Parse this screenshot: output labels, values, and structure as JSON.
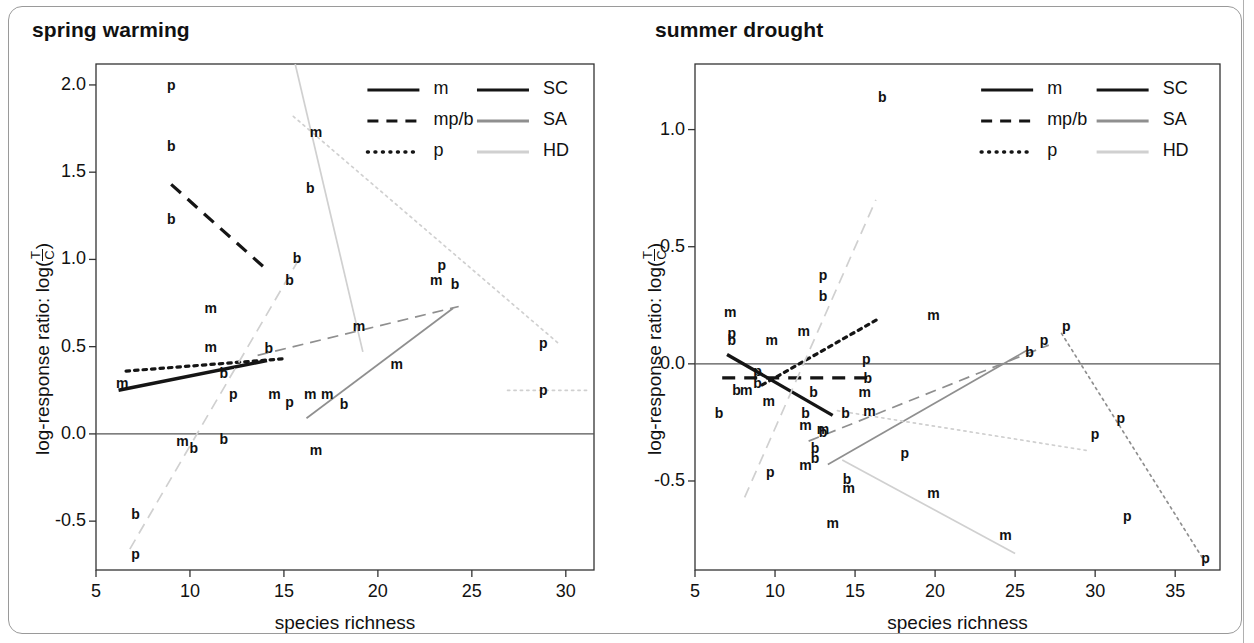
{
  "figure": {
    "panels": [
      {
        "id": "spring-warming",
        "title": "spring warming",
        "xlabel": "species richness",
        "ylabel_prefix": "log-response ratio: log(",
        "ylabel_num": "T",
        "ylabel_den": "C",
        "ylabel_suffix": ")",
        "xticks": [
          "5",
          "10",
          "15",
          "20",
          "25",
          "30"
        ],
        "yticks": [
          "2.0",
          "1.5",
          "1.0",
          "0.5",
          "0.0",
          "-0.5"
        ]
      },
      {
        "id": "summer-drought",
        "title": "summer drought",
        "xlabel": "species richness",
        "ylabel_prefix": "log-response ratio: log(",
        "ylabel_num": "T",
        "ylabel_den": "C",
        "ylabel_suffix": ")",
        "xticks": [
          "5",
          "10",
          "15",
          "20",
          "25",
          "30",
          "35"
        ],
        "yticks": [
          "1.0",
          "0.5",
          "0.0",
          "-0.5"
        ]
      }
    ],
    "legend": {
      "linestyle_entries": [
        {
          "label": "m",
          "style": "solid"
        },
        {
          "label": "mp/b",
          "style": "dashed"
        },
        {
          "label": "p",
          "style": "dotted"
        }
      ],
      "color_entries": [
        {
          "label": "SC",
          "color": "#151515"
        },
        {
          "label": "SA",
          "color": "#8f8f8f"
        },
        {
          "label": "HD",
          "color": "#d0d0d0"
        }
      ]
    },
    "colors": {
      "SC": "#151515",
      "SA": "#8f8f8f",
      "HD": "#d0d0d0",
      "zero_line": "#555555",
      "axis": "#333333"
    }
  },
  "chart_data": [
    {
      "type": "scatter",
      "title": "spring warming",
      "xlabel": "species richness",
      "ylabel": "log-response ratio: log(T/C)",
      "xlim": [
        5,
        31.5
      ],
      "ylim": [
        -0.78,
        2.12
      ],
      "xticks": [
        5,
        10,
        15,
        20,
        25,
        30
      ],
      "yticks": [
        2.0,
        1.5,
        1.0,
        0.5,
        0.0,
        -0.5
      ],
      "grid": false,
      "zero_reference_line": 0.0,
      "legend_position": "top-right",
      "point_label_key": "m = mass loss, b = biomass, p = plant/production",
      "points": [
        {
          "label": "p",
          "x": 9.0,
          "y": 2.0
        },
        {
          "label": "b",
          "x": 9.0,
          "y": 1.65
        },
        {
          "label": "b",
          "x": 9.0,
          "y": 1.23
        },
        {
          "label": "m",
          "x": 16.7,
          "y": 1.73
        },
        {
          "label": "b",
          "x": 16.4,
          "y": 1.41
        },
        {
          "label": "b",
          "x": 15.7,
          "y": 1.01
        },
        {
          "label": "b",
          "x": 15.3,
          "y": 0.88
        },
        {
          "label": "p",
          "x": 23.4,
          "y": 0.97
        },
        {
          "label": "m",
          "x": 23.1,
          "y": 0.88
        },
        {
          "label": "b",
          "x": 24.1,
          "y": 0.86
        },
        {
          "label": "m",
          "x": 11.1,
          "y": 0.72
        },
        {
          "label": "m",
          "x": 11.1,
          "y": 0.5
        },
        {
          "label": "b",
          "x": 14.2,
          "y": 0.49
        },
        {
          "label": "m",
          "x": 19.0,
          "y": 0.62
        },
        {
          "label": "m",
          "x": 21.0,
          "y": 0.4
        },
        {
          "label": "b",
          "x": 11.8,
          "y": 0.35
        },
        {
          "label": "m",
          "x": 6.4,
          "y": 0.29
        },
        {
          "label": "p",
          "x": 28.8,
          "y": 0.52
        },
        {
          "label": "p",
          "x": 28.8,
          "y": 0.25
        },
        {
          "label": "p",
          "x": 12.3,
          "y": 0.23
        },
        {
          "label": "m",
          "x": 14.5,
          "y": 0.23
        },
        {
          "label": "p",
          "x": 15.3,
          "y": 0.18
        },
        {
          "label": "m",
          "x": 16.4,
          "y": 0.23
        },
        {
          "label": "m",
          "x": 17.3,
          "y": 0.23
        },
        {
          "label": "b",
          "x": 18.2,
          "y": 0.17
        },
        {
          "label": "m",
          "x": 9.6,
          "y": -0.04
        },
        {
          "label": "b",
          "x": 11.8,
          "y": -0.03
        },
        {
          "label": "b",
          "x": 10.2,
          "y": -0.08
        },
        {
          "label": "m",
          "x": 16.7,
          "y": -0.09
        },
        {
          "label": "b",
          "x": 7.1,
          "y": -0.46
        },
        {
          "label": "p",
          "x": 7.1,
          "y": -0.69
        }
      ],
      "trend_lines": [
        {
          "group": "SC",
          "type": "m",
          "style": "solid",
          "color": "#151515",
          "x": [
            6.2,
            14.1
          ],
          "y": [
            0.25,
            0.42
          ]
        },
        {
          "group": "SC",
          "type": "mp/b",
          "style": "dashed",
          "color": "#151515",
          "x": [
            9.0,
            14.2
          ],
          "y": [
            1.43,
            0.93
          ]
        },
        {
          "group": "SC",
          "type": "p",
          "style": "dotted",
          "color": "#151515",
          "x": [
            6.6,
            14.9
          ],
          "y": [
            0.36,
            0.43
          ]
        },
        {
          "group": "SA",
          "type": "m",
          "style": "solid",
          "color": "#8f8f8f",
          "x": [
            16.2,
            24.0
          ],
          "y": [
            0.09,
            0.72
          ]
        },
        {
          "group": "SA",
          "type": "mp/b",
          "style": "dashed",
          "color": "#8f8f8f",
          "x": [
            13.6,
            24.3
          ],
          "y": [
            0.45,
            0.73
          ]
        },
        {
          "group": "HD",
          "type": "m",
          "style": "solid",
          "color": "#d0d0d0",
          "x": [
            15.6,
            19.2
          ],
          "y": [
            2.12,
            0.47
          ]
        },
        {
          "group": "HD",
          "type": "mp/b",
          "style": "dashed",
          "color": "#d0d0d0",
          "x": [
            6.8,
            15.9
          ],
          "y": [
            -0.66,
            1.02
          ]
        },
        {
          "group": "HD",
          "type": "p",
          "style": "dotted",
          "color": "#d0d0d0",
          "x": [
            15.5,
            29.6
          ],
          "y": [
            1.82,
            0.52
          ]
        },
        {
          "group": "HD",
          "type": "p2",
          "style": "dotted",
          "color": "#d0d0d0",
          "x": [
            26.9,
            31.3
          ],
          "y": [
            0.25,
            0.25
          ]
        }
      ]
    },
    {
      "type": "scatter",
      "title": "summer drought",
      "xlabel": "species richness",
      "ylabel": "log-response ratio: log(T/C)",
      "xlim": [
        5,
        37.8
      ],
      "ylim": [
        -0.88,
        1.28
      ],
      "xticks": [
        5,
        10,
        15,
        20,
        25,
        30,
        35
      ],
      "yticks": [
        1.0,
        0.5,
        0.0,
        -0.5
      ],
      "grid": false,
      "zero_reference_line": 0.0,
      "legend_position": "top-right",
      "points": [
        {
          "label": "b",
          "x": 16.7,
          "y": 1.14
        },
        {
          "label": "p",
          "x": 13.0,
          "y": 0.38
        },
        {
          "label": "b",
          "x": 13.0,
          "y": 0.29
        },
        {
          "label": "m",
          "x": 7.2,
          "y": 0.22
        },
        {
          "label": "m",
          "x": 19.9,
          "y": 0.21
        },
        {
          "label": "b",
          "x": 7.3,
          "y": 0.1
        },
        {
          "label": "p",
          "x": 7.3,
          "y": 0.13
        },
        {
          "label": "m",
          "x": 9.8,
          "y": 0.1
        },
        {
          "label": "m",
          "x": 11.8,
          "y": 0.14
        },
        {
          "label": "p",
          "x": 26.8,
          "y": 0.1
        },
        {
          "label": "b",
          "x": 25.9,
          "y": 0.05
        },
        {
          "label": "p",
          "x": 15.7,
          "y": 0.02
        },
        {
          "label": "p",
          "x": 8.9,
          "y": -0.03
        },
        {
          "label": "b",
          "x": 15.8,
          "y": -0.06
        },
        {
          "label": "b",
          "x": 8.9,
          "y": -0.08
        },
        {
          "label": "b",
          "x": 7.6,
          "y": -0.11
        },
        {
          "label": "m",
          "x": 8.2,
          "y": -0.11
        },
        {
          "label": "b",
          "x": 12.4,
          "y": -0.12
        },
        {
          "label": "m",
          "x": 15.6,
          "y": -0.12
        },
        {
          "label": "m",
          "x": 9.6,
          "y": -0.16
        },
        {
          "label": "b",
          "x": 6.5,
          "y": -0.21
        },
        {
          "label": "b",
          "x": 11.9,
          "y": -0.21
        },
        {
          "label": "b",
          "x": 14.4,
          "y": -0.21
        },
        {
          "label": "m",
          "x": 15.9,
          "y": -0.2
        },
        {
          "label": "m",
          "x": 11.9,
          "y": -0.26
        },
        {
          "label": "m",
          "x": 13.0,
          "y": -0.28
        },
        {
          "label": "b",
          "x": 13.0,
          "y": -0.29
        },
        {
          "label": "p",
          "x": 28.2,
          "y": 0.16
        },
        {
          "label": "p",
          "x": 31.6,
          "y": -0.23
        },
        {
          "label": "p",
          "x": 30.0,
          "y": -0.3
        },
        {
          "label": "b",
          "x": 12.5,
          "y": -0.36
        },
        {
          "label": "b",
          "x": 12.5,
          "y": -0.4
        },
        {
          "label": "m",
          "x": 11.9,
          "y": -0.43
        },
        {
          "label": "p",
          "x": 9.7,
          "y": -0.46
        },
        {
          "label": "p",
          "x": 18.1,
          "y": -0.38
        },
        {
          "label": "b",
          "x": 14.5,
          "y": -0.49
        },
        {
          "label": "m",
          "x": 14.6,
          "y": -0.53
        },
        {
          "label": "m",
          "x": 19.9,
          "y": -0.55
        },
        {
          "label": "p",
          "x": 32.0,
          "y": -0.65
        },
        {
          "label": "m",
          "x": 13.6,
          "y": -0.68
        },
        {
          "label": "m",
          "x": 24.4,
          "y": -0.73
        },
        {
          "label": "p",
          "x": 36.9,
          "y": -0.83
        }
      ],
      "trend_lines": [
        {
          "group": "SC",
          "type": "m",
          "style": "solid",
          "color": "#151515",
          "x": [
            7.0,
            13.6
          ],
          "y": [
            0.04,
            -0.22
          ]
        },
        {
          "group": "SC",
          "type": "mp/b",
          "style": "dashed",
          "color": "#151515",
          "x": [
            6.7,
            16.0
          ],
          "y": [
            -0.06,
            -0.06
          ]
        },
        {
          "group": "SC",
          "type": "p",
          "style": "dotted",
          "color": "#151515",
          "x": [
            9.2,
            16.4
          ],
          "y": [
            -0.09,
            0.19
          ]
        },
        {
          "group": "SA",
          "type": "m",
          "style": "solid",
          "color": "#8f8f8f",
          "x": [
            13.3,
            25.8
          ],
          "y": [
            -0.43,
            0.06
          ]
        },
        {
          "group": "SA",
          "type": "mp/b",
          "style": "dashed",
          "color": "#8f8f8f",
          "x": [
            12.1,
            27.1
          ],
          "y": [
            -0.33,
            0.08
          ]
        },
        {
          "group": "SA",
          "type": "p",
          "style": "dotted",
          "color": "#8f8f8f",
          "x": [
            27.9,
            36.9
          ],
          "y": [
            0.13,
            -0.85
          ]
        },
        {
          "group": "HD",
          "type": "m",
          "style": "solid",
          "color": "#d0d0d0",
          "x": [
            14.2,
            25.0
          ],
          "y": [
            -0.41,
            -0.81
          ]
        },
        {
          "group": "HD",
          "type": "mp/b",
          "style": "dashed",
          "color": "#d0d0d0",
          "x": [
            8.1,
            16.3
          ],
          "y": [
            -0.57,
            0.7
          ]
        },
        {
          "group": "HD",
          "type": "p",
          "style": "dotted",
          "color": "#d0d0d0",
          "x": [
            13.9,
            29.5
          ],
          "y": [
            -0.2,
            -0.37
          ]
        }
      ]
    }
  ]
}
